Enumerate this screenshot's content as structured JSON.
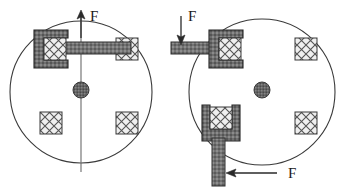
{
  "figure": {
    "background_color": "#ffffff",
    "stroke_color": "#3a3a3a",
    "clamp_fill": "#6e6e6e",
    "pad_fill": "#efefef",
    "hub_fill": "#636363",
    "arm_fill": "#727272",
    "label_color": "#1a1a1a"
  },
  "left_figure": {
    "name": "single-clamp-disc",
    "disc": {
      "center_x": 81,
      "center_y": 92,
      "radius": 71
    },
    "hub": {
      "center_x": 81,
      "center_y": 90,
      "radius": 8
    },
    "axis_line": {
      "x": 81,
      "y_top": 14,
      "y_bottom": 172
    },
    "pads": [
      {
        "id": "pad-top-left",
        "x": 40,
        "y": 38,
        "size": 22
      },
      {
        "id": "pad-top-right",
        "x": 116,
        "y": 38,
        "size": 22
      },
      {
        "id": "pad-bottom-left",
        "x": 40,
        "y": 112,
        "size": 22
      },
      {
        "id": "pad-bottom-right",
        "x": 116,
        "y": 112,
        "size": 22
      }
    ],
    "clamp": {
      "id": "clamp-top-left",
      "orientation": "horizontal-open-right",
      "x": 34,
      "y": 30,
      "width": 34,
      "height": 38
    },
    "arm": {
      "id": "arm-horizontal",
      "x": 62,
      "y": 42,
      "width": 69,
      "height": 12
    },
    "force_arrow": {
      "id": "force-arrow-up",
      "direction": "up",
      "x": 81,
      "y_tail": 36,
      "y_head": 12,
      "label": "F",
      "label_x": 90,
      "label_y": 17
    }
  },
  "right_figure": {
    "name": "dual-clamp-disc",
    "disc": {
      "center_x": 262,
      "center_y": 92,
      "radius": 73
    },
    "hub": {
      "center_x": 262,
      "center_y": 90,
      "radius": 8
    },
    "pads": [
      {
        "id": "pad-top-left",
        "x": 215,
        "y": 38,
        "size": 22
      },
      {
        "id": "pad-top-right",
        "x": 295,
        "y": 38,
        "size": 22
      },
      {
        "id": "pad-bottom-left",
        "x": 208,
        "y": 112,
        "size": 22
      },
      {
        "id": "pad-bottom-right",
        "x": 295,
        "y": 112,
        "size": 22
      }
    ],
    "clamps": [
      {
        "id": "clamp-top-left",
        "orientation": "horizontal-open-right",
        "x": 209,
        "y": 30,
        "width": 34,
        "height": 38
      },
      {
        "id": "clamp-bottom-left",
        "orientation": "vertical-open-top",
        "x": 202,
        "y": 105,
        "width": 36,
        "height": 36
      }
    ],
    "arms": [
      {
        "id": "arm-horizontal-left",
        "x": 171,
        "y": 42,
        "width": 42,
        "height": 12
      },
      {
        "id": "arm-vertical-bottom",
        "x": 212,
        "y": 133,
        "width": 13,
        "height": 53
      }
    ],
    "force_arrows": [
      {
        "id": "force-arrow-down",
        "direction": "down",
        "x": 181,
        "y_tail": 16,
        "y_head": 42,
        "label": "F",
        "label_x": 187,
        "label_y": 18
      },
      {
        "id": "force-arrow-left",
        "direction": "left",
        "y": 173,
        "x_tail": 277,
        "x_head": 229,
        "label": "F",
        "label_x": 289,
        "label_y": 178
      }
    ]
  },
  "labels": {
    "force_symbol": "F"
  }
}
